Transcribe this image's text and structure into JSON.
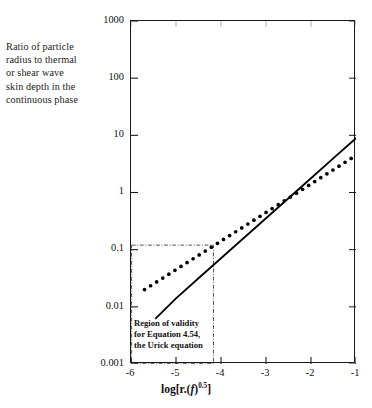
{
  "figure": {
    "y_caption_lines": [
      "Ratio of particle",
      "radius to thermal",
      "or shear wave",
      "skin depth in the",
      "continuous phase"
    ],
    "x_axis_title_prefix": "log[r.(",
    "x_axis_title_italic": "f",
    "x_axis_title_mid": ")",
    "x_axis_title_sup": "0.5",
    "x_axis_title_suffix": "]",
    "annotation_lines": [
      "Region of validity",
      "for Equation 4.54,",
      "the Urick equation"
    ]
  },
  "chart_data": {
    "type": "line",
    "title": "",
    "xlabel": "log[r.(f)^0.5]",
    "ylabel": "Ratio of particle radius to thermal or shear wave skin depth in the continuous phase",
    "xscale": "linear",
    "yscale": "log",
    "xlim": [
      -6,
      -1
    ],
    "ylim": [
      0.001,
      1000
    ],
    "xticks": [
      -6,
      -5,
      -4,
      -3,
      -2,
      -1
    ],
    "xticklabels": [
      "-6",
      "-5",
      "-4",
      "-3",
      "-2",
      "-1"
    ],
    "yticks": [
      0.001,
      0.01,
      0.1,
      1,
      10,
      100,
      1000
    ],
    "yticklabels": [
      "0.001",
      "0.01",
      "0.1",
      "1",
      "10",
      "100",
      "1000"
    ],
    "grid": false,
    "legend": null,
    "series": [
      {
        "name": "thermal skin depth ratio",
        "style": "dotted",
        "color": "#000000",
        "x": [
          -5.7,
          -5.4,
          -5.1,
          -4.8,
          -4.5,
          -4.2,
          -3.9,
          -3.6,
          -3.3,
          -3.0,
          -2.7,
          -2.4,
          -2.1,
          -1.8,
          -1.5,
          -1.2,
          -1.0
        ],
        "y": [
          0.02,
          0.0282,
          0.0398,
          0.0562,
          0.0794,
          0.1122,
          0.1585,
          0.2239,
          0.3162,
          0.4467,
          0.631,
          0.8913,
          1.259,
          1.778,
          2.512,
          3.548,
          4.467
        ]
      },
      {
        "name": "shear wave skin depth ratio",
        "style": "solid",
        "color": "#000000",
        "x": [
          -5.45,
          -5.0,
          -4.5,
          -4.0,
          -3.5,
          -3.0,
          -2.5,
          -2.0,
          -1.5,
          -1.0
        ],
        "y": [
          0.0063,
          0.0141,
          0.0316,
          0.0708,
          0.1585,
          0.3548,
          0.7943,
          1.778,
          3.981,
          8.913
        ]
      }
    ],
    "annotations": [
      {
        "name": "region-of-validity",
        "text": "Region of validity for Equation 4.54, the Urick equation",
        "shape": "rectangle",
        "linestyle": "dashdot",
        "x_range": [
          -6.0,
          -4.18
        ],
        "y_range": [
          0.001,
          0.12
        ]
      }
    ]
  }
}
